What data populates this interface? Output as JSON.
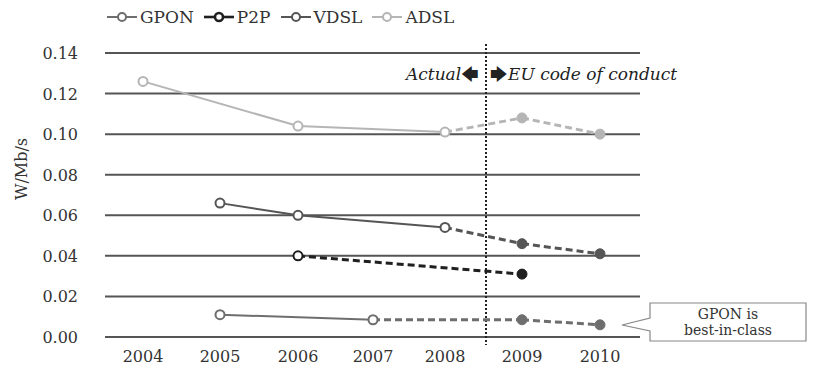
{
  "chart_data": {
    "type": "line",
    "title": "",
    "xlabel": "",
    "ylabel": "W/Mb/s",
    "ylim": [
      0,
      0.14
    ],
    "yticks": [
      "0.00",
      "0.02",
      "0.04",
      "0.06",
      "0.08",
      "0.10",
      "0.12",
      "0.14"
    ],
    "categories": [
      "2004",
      "2005",
      "2006",
      "2007",
      "2008",
      "2009",
      "2010"
    ],
    "grid": true,
    "legend_position": "top",
    "divider": {
      "between": [
        "2008",
        "2009"
      ],
      "style": "dotted"
    },
    "annotations": {
      "left_label": "Actual",
      "right_label": "EU code of conduct",
      "callout": [
        "GPON is",
        "best-in-class"
      ]
    },
    "series": [
      {
        "name": "GPON",
        "color": "#6e6e6e",
        "values": [
          null,
          0.011,
          null,
          0.0085,
          null,
          0.0085,
          0.006
        ],
        "actual_until": "2007"
      },
      {
        "name": "P2P",
        "color": "#1f1f1f",
        "values": [
          null,
          null,
          0.04,
          null,
          null,
          0.031,
          null
        ],
        "actual_until": "2006"
      },
      {
        "name": "VDSL",
        "color": "#555555",
        "values": [
          null,
          0.066,
          0.06,
          null,
          0.054,
          0.046,
          0.041
        ],
        "actual_until": "2008"
      },
      {
        "name": "ADSL",
        "color": "#b5b5b5",
        "values": [
          0.126,
          null,
          0.104,
          null,
          0.101,
          0.108,
          0.1
        ],
        "actual_until": "2008"
      }
    ]
  },
  "legend": [
    {
      "name": "GPON",
      "color": "#6e6e6e"
    },
    {
      "name": "P2P",
      "color": "#1f1f1f"
    },
    {
      "name": "VDSL",
      "color": "#555555"
    },
    {
      "name": "ADSL",
      "color": "#b5b5b5"
    }
  ],
  "annotations": {
    "actual": "Actual",
    "eu": "EU code of conduct",
    "callout_line1": "GPON is",
    "callout_line2": "best-in-class"
  },
  "ylabel": "W/Mb/s"
}
